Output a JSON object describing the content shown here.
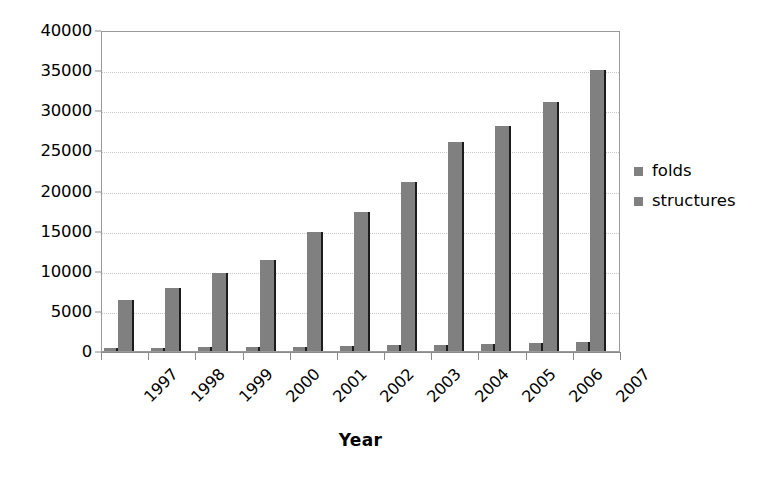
{
  "chart_data": {
    "type": "bar",
    "title": "",
    "subtitle": "",
    "xlabel": "Year",
    "ylabel": "",
    "categories": [
      "1997",
      "1998",
      "1999",
      "2000",
      "2001",
      "2002",
      "2003",
      "2004",
      "2005",
      "2006",
      "2007"
    ],
    "series": [
      {
        "name": "folds",
        "color": "#808080",
        "values": [
          400,
          430,
          470,
          520,
          560,
          620,
          690,
          800,
          890,
          975,
          1080
        ]
      },
      {
        "name": "structures",
        "color": "#808080",
        "values": [
          6400,
          7800,
          9700,
          11300,
          14800,
          17300,
          21000,
          26000,
          28000,
          31000,
          35000
        ]
      }
    ],
    "ylim": [
      0,
      40000
    ],
    "ytick_step": 5000,
    "yticks": [
      "0",
      "5000",
      "10000",
      "15000",
      "20000",
      "25000",
      "30000",
      "35000",
      "40000"
    ],
    "grid": {
      "horizontal": true,
      "vertical": false,
      "style": "dotted",
      "color": "#c8c8c8"
    },
    "legend": {
      "position": "right",
      "entries": [
        "folds",
        "structures"
      ]
    },
    "axis": {
      "x_tick_label_rotation": -45,
      "plot_border_color": "#9a9a9a",
      "tick_color": "#8a8a8a"
    },
    "bar_style": {
      "fill": "#808080",
      "shadow_edge": "#1c1c1c"
    }
  }
}
